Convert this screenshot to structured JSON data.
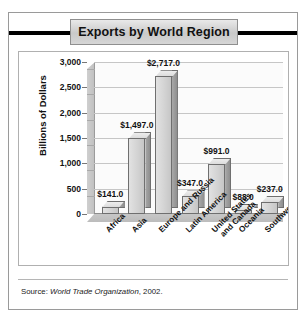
{
  "figure": {
    "title": "Exports by World Region",
    "source_prefix": "Source:",
    "source_org": "World Trade Organization",
    "source_year": ", 2002."
  },
  "chart_data": {
    "type": "bar",
    "title": "Exports by World Region",
    "xlabel": "",
    "ylabel": "Billions of Dollars",
    "ylim": [
      0,
      3000
    ],
    "yticks": [
      "0",
      "500",
      "1,000",
      "1,500",
      "2,000",
      "2,500",
      "3,000"
    ],
    "ytick_values": [
      0,
      500,
      1000,
      1500,
      2000,
      2500,
      3000
    ],
    "grid": true,
    "legend": false,
    "categories": [
      "Africa",
      "Asia",
      "Europe and Russia",
      "Latin America",
      "United States\nand Canada",
      "Oceania",
      "Southwest Asia"
    ],
    "values": [
      141.0,
      1497.0,
      2717.0,
      347.0,
      991.0,
      88.0,
      237.0
    ],
    "data_labels": [
      "$141.0",
      "$1,497.0",
      "$2,717.0",
      "$347.0",
      "$991.0",
      "$88.0",
      "$237.0"
    ],
    "bars": [
      {
        "category": "Africa",
        "line1": "Africa",
        "line2": "",
        "value": 141.0,
        "label": "$141.0"
      },
      {
        "category": "Asia",
        "line1": "Asia",
        "line2": "",
        "value": 1497.0,
        "label": "$1,497.0"
      },
      {
        "category": "Europe and Russia",
        "line1": "Europe and Russia",
        "line2": "",
        "value": 2717.0,
        "label": "$2,717.0"
      },
      {
        "category": "Latin America",
        "line1": "Latin America",
        "line2": "",
        "value": 347.0,
        "label": "$347.0"
      },
      {
        "category": "United States and Canada",
        "line1": "United States",
        "line2": "and Canada",
        "value": 991.0,
        "label": "$991.0"
      },
      {
        "category": "Oceania",
        "line1": "Oceania",
        "line2": "",
        "value": 88.0,
        "label": "$88.0"
      },
      {
        "category": "Southwest Asia",
        "line1": "Southwest Asia",
        "line2": "",
        "value": 237.0,
        "label": "$237.0"
      }
    ],
    "colors": {
      "bar_front": "#d6d6d6",
      "bar_side": "#9a9a9a",
      "plot_background": "#fbfbfb",
      "gridline": "#c6c6c6",
      "title_banner": "#d6d6d6"
    }
  }
}
